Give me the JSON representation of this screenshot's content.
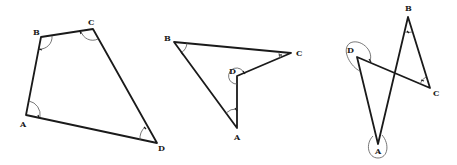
{
  "diagram": {
    "type": "geometry-quadrilaterals",
    "figures": [
      {
        "name": "convex-quadrilateral",
        "vertices": [
          {
            "label": "A",
            "x": 26,
            "y": 115,
            "lx": 20,
            "ly": 127
          },
          {
            "label": "B",
            "x": 41,
            "y": 37,
            "lx": 33,
            "ly": 35
          },
          {
            "label": "C",
            "x": 93,
            "y": 29,
            "lx": 88,
            "ly": 25
          },
          {
            "label": "D",
            "x": 157,
            "y": 143,
            "lx": 158,
            "ly": 151
          }
        ]
      },
      {
        "name": "concave-quadrilateral",
        "vertices": [
          {
            "label": "A",
            "x": 237,
            "y": 128,
            "lx": 234,
            "ly": 140
          },
          {
            "label": "B",
            "x": 174,
            "y": 42,
            "lx": 164,
            "ly": 41
          },
          {
            "label": "C",
            "x": 291,
            "y": 53,
            "lx": 296,
            "ly": 56
          },
          {
            "label": "D",
            "x": 237,
            "y": 76,
            "lx": 229,
            "ly": 74
          }
        ]
      },
      {
        "name": "crossed-quadrilateral",
        "vertices": [
          {
            "label": "A",
            "x": 378,
            "y": 144,
            "lx": 375,
            "ly": 154
          },
          {
            "label": "B",
            "x": 408,
            "y": 17,
            "lx": 405,
            "ly": 11
          },
          {
            "label": "C",
            "x": 430,
            "y": 88,
            "lx": 433,
            "ly": 96
          },
          {
            "label": "D",
            "x": 357,
            "y": 57,
            "lx": 347,
            "ly": 53
          }
        ]
      }
    ]
  }
}
